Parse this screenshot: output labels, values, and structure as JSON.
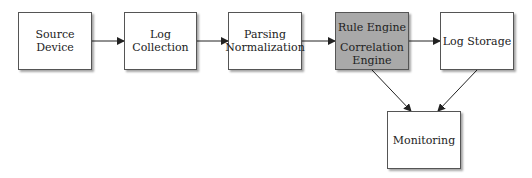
{
  "diagram": {
    "type": "flowchart",
    "nodes": [
      {
        "id": "source",
        "label": "Source Device"
      },
      {
        "id": "collection",
        "label": "Log Collection"
      },
      {
        "id": "parsing",
        "label": "Parsing Normalization",
        "line1": "Parsing",
        "line2": "Normalization"
      },
      {
        "id": "engine",
        "label_top": "Rule Engine",
        "label_bottom": "Correlation Engine",
        "highlight": "#a9a9a9"
      },
      {
        "id": "storage",
        "label": "Log Storage"
      },
      {
        "id": "monitoring",
        "label": "Monitoring"
      }
    ],
    "edges": [
      {
        "from": "source",
        "to": "collection"
      },
      {
        "from": "collection",
        "to": "parsing"
      },
      {
        "from": "parsing",
        "to": "engine"
      },
      {
        "from": "engine",
        "to": "storage"
      },
      {
        "from": "engine",
        "to": "monitoring"
      },
      {
        "from": "storage",
        "to": "monitoring"
      }
    ]
  }
}
